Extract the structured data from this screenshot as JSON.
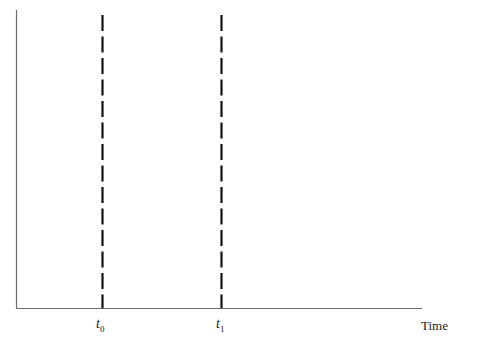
{
  "diagram": {
    "type": "timeline",
    "x_axis_label": "Time",
    "markers": [
      {
        "name": "t",
        "subscript": "0",
        "x": 102
      },
      {
        "name": "t",
        "subscript": "1",
        "x": 221
      }
    ],
    "colors": {
      "axis": "#6b6b6b",
      "dash": "#111111",
      "text": "#222222"
    }
  }
}
